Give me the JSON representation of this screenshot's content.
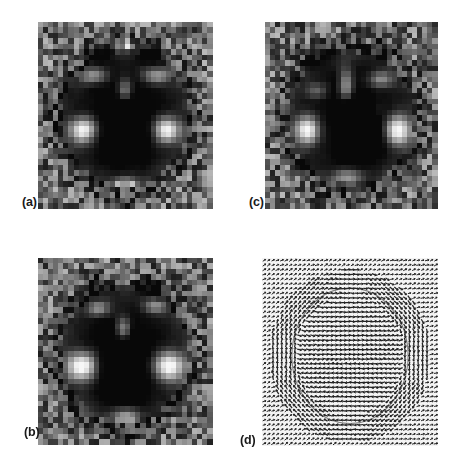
{
  "figure": {
    "type": "multi-panel-scientific-figure",
    "layout": "2x2",
    "background_color": "#ffffff",
    "panel_count": 4
  },
  "panels": [
    {
      "id": "a",
      "label": "(a)",
      "position": "top-left",
      "kind": "grayscale-intensity-map",
      "grid": 34,
      "colormap": "grayscale",
      "features": {
        "center": "dark-square-core",
        "lobes": "two-bright-lobes-left-and-right",
        "upper_pattern": "bright-butterfly-cross",
        "lower_pattern": "bright-horizontal-bar",
        "border": "noisy-mid-gray-speckle"
      }
    },
    {
      "id": "b",
      "label": "(b)",
      "position": "bottom-left",
      "kind": "grayscale-intensity-map",
      "grid": 34,
      "colormap": "grayscale",
      "features": {
        "center": "dark-square-core",
        "lobes": "two-broad-diffuse-bright-lobes",
        "upper_pattern": "bright-vertical-stem-with-wings",
        "lower_pattern": "bright-horizontal-bar-with-dark-notch",
        "border": "noisy-mid-gray-speckle"
      }
    },
    {
      "id": "c",
      "label": "(c)",
      "position": "top-right",
      "kind": "grayscale-intensity-map",
      "grid": 34,
      "colormap": "grayscale",
      "features": {
        "center": "dark-square-core-offset-right",
        "lobes": "asymmetric-bright-lobes",
        "upper_pattern": "bright-vertical-bar-and-cross",
        "lower_pattern": "bright-arc",
        "border": "noisy-mid-gray-speckle"
      }
    },
    {
      "id": "d",
      "label": "(d)",
      "position": "bottom-right",
      "kind": "vector-quiver-field",
      "grid": 40,
      "background_color": "#f2f2f2",
      "arrow_color": "#232323",
      "features": {
        "flow": "circular-vortex-around-central-region",
        "outer_field": "near-uniform-diagonal-arrows",
        "inner_field": "dense-horizontal-arrows-in-core"
      }
    }
  ],
  "chart_data": {
    "type": "heatmap",
    "title": "",
    "xlabel": "",
    "ylabel": "",
    "grid": false,
    "legend_position": "none",
    "panels": [
      {
        "panel": "a",
        "type": "heatmap",
        "nx": 34,
        "ny": 34,
        "value_range": [
          0,
          1
        ],
        "colormap": "gray",
        "annotations": [
          "(a)"
        ]
      },
      {
        "panel": "b",
        "type": "heatmap",
        "nx": 34,
        "ny": 34,
        "value_range": [
          0,
          1
        ],
        "colormap": "gray",
        "annotations": [
          "(b)"
        ]
      },
      {
        "panel": "c",
        "type": "heatmap",
        "nx": 34,
        "ny": 34,
        "value_range": [
          0,
          1
        ],
        "colormap": "gray",
        "annotations": [
          "(c)"
        ]
      },
      {
        "panel": "d",
        "type": "scatter",
        "nx": 40,
        "ny": 40,
        "value_range": [
          0,
          1
        ],
        "colormap": "gray",
        "annotations": [
          "(d)"
        ]
      }
    ]
  }
}
